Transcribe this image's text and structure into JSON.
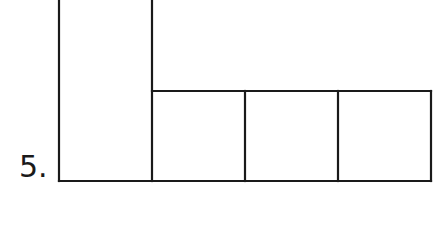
{
  "problem": {
    "number_label": "5."
  },
  "figure": {
    "shapes": [
      {
        "name": "tall-rectangle"
      },
      {
        "name": "square-1"
      },
      {
        "name": "square-2"
      },
      {
        "name": "square-3"
      }
    ],
    "line_color": "#1a1a1a"
  }
}
